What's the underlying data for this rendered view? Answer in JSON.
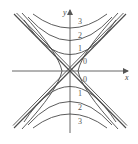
{
  "figure": {
    "axes": {
      "x_label": "x",
      "y_label": "y"
    },
    "colors": {
      "curve": "#4a4a4a",
      "axis": "#555555",
      "background": "#ffffff"
    },
    "contours": {
      "upper": [
        {
          "level": "3",
          "vertex_y": 27
        },
        {
          "level": "2",
          "vertex_y": 40
        },
        {
          "level": "1",
          "vertex_y": 54
        }
      ],
      "lower": [
        {
          "level": "1",
          "vertex_y": 86
        },
        {
          "level": "2",
          "vertex_y": 101
        },
        {
          "level": "3",
          "vertex_y": 114
        }
      ],
      "asymptote_levels": [
        "0",
        "0"
      ]
    },
    "labels": {
      "upper_3": "3",
      "upper_2": "2",
      "upper_1": "1",
      "upper_0": "0",
      "lower_0": "0",
      "lower_1": "1",
      "lower_2": "2",
      "lower_3": "3"
    }
  }
}
